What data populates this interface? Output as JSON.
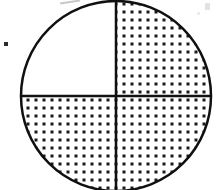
{
  "figure": {
    "kind": "fraction-circle-diagram",
    "title": "Circle divided into four equal quadrants",
    "shape": "circle",
    "total_parts": 4,
    "shaded_parts": 3,
    "unshaded_parts": 1,
    "fraction_shaded": "3/4",
    "fraction_unshaded": "1/4",
    "shaded_percent": 75,
    "geometry": {
      "center_x": 116,
      "center_y": 96,
      "radius": 95,
      "cropped_top": true,
      "cropped_bottom": true,
      "divider_lines": 2,
      "divider_orientation": [
        "vertical",
        "horizontal"
      ],
      "outline_width": 2.5,
      "divider_width": 2.5
    },
    "colors": {
      "background": "#ffffff",
      "outline": "#101010",
      "divider": "#101010",
      "fill_dot": "#1a1a1a",
      "fill_background": "#ffffff"
    },
    "fill_pattern": {
      "name": "square-dot-stipple",
      "dot_shape": "square",
      "dot_size_px": 3,
      "spacing_px": 8
    },
    "quadrants": [
      {
        "id": "top-left",
        "label": "Top left quadrant",
        "position": "upper-left",
        "shaded": false,
        "fill": "none"
      },
      {
        "id": "top-right",
        "label": "Top right quadrant",
        "position": "upper-right",
        "shaded": true,
        "fill": "square-dot-stipple"
      },
      {
        "id": "bottom-left",
        "label": "Bottom left quadrant",
        "position": "lower-left",
        "shaded": true,
        "fill": "square-dot-stipple"
      },
      {
        "id": "bottom-right",
        "label": "Bottom right quadrant",
        "position": "lower-right",
        "shaded": true,
        "fill": "square-dot-stipple"
      }
    ],
    "artifacts": [
      {
        "id": "speck-left",
        "label": "scan speck",
        "x": 4,
        "y": 42
      },
      {
        "id": "smudge-top",
        "label": "scan smudge",
        "x": 60,
        "y": 1
      },
      {
        "id": "speck-top-right",
        "label": "faint scan mark",
        "x": 205,
        "y": 3
      }
    ]
  }
}
